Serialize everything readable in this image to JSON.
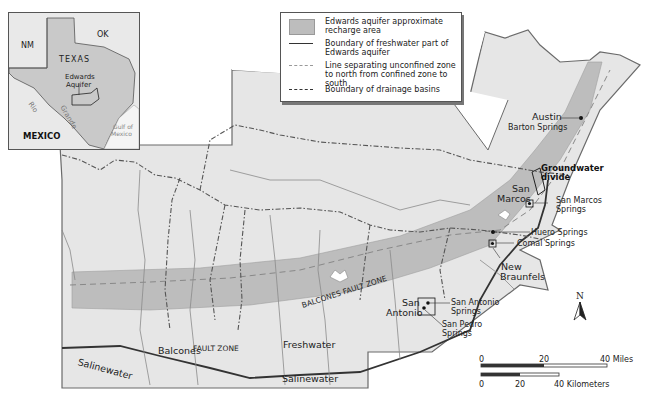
{
  "legend": {
    "items": [
      {
        "symbol": "gray-fill",
        "label": "Edwards aquifer approximate recharge area"
      },
      {
        "symbol": "solid-line",
        "label": "Boundary of freshwater part of Edwards aquifer"
      },
      {
        "symbol": "dashed-line",
        "label": "Line separating unconfined zone to north from confined zone to south"
      },
      {
        "symbol": "dash-dot-line",
        "label": "Boundary of drainage basins"
      }
    ]
  },
  "inset": {
    "labels": {
      "nm": "NM",
      "ok": "OK",
      "texas": "TEXAS",
      "aquifer_line1": "Edwards",
      "aquifer_line2": "Aquifer",
      "rio": "Rio",
      "grande": "Grande",
      "gulf_line1": "Gulf of",
      "gulf_line2": "Mexico",
      "mexico": "MEXICO"
    }
  },
  "map": {
    "labels": {
      "austin": "Austin",
      "barton_springs": "Barton Springs",
      "groundwater_divide_line1": "Groundwater",
      "groundwater_divide_line2": "divide",
      "san_marcos_line1": "San",
      "san_marcos_line2": "Marcos",
      "san_marcos_springs_line1": "San Marcos",
      "san_marcos_springs_line2": "Springs",
      "huero_springs": "Huero Springs",
      "comal_springs": "Comal Springs",
      "new_braunfels_line1": "New",
      "new_braunfels_line2": "Braunfels",
      "san_antonio_line1": "San",
      "san_antonio_line2": "Antonio",
      "san_antonio_springs_line1": "San Antonio",
      "san_antonio_springs_line2": "Springs",
      "san_pedro_springs_line1": "San Pedro",
      "san_pedro_springs_line2": "Springs",
      "balcones_fault_zone": "BALCONES FAULT ZONE",
      "balcones": "Balcones",
      "fault_zone": "FAULT ZONE",
      "freshwater": "Freshwater",
      "salinewater_west": "Salinewater",
      "salinewater_south": "Salinewater"
    },
    "north_arrow": "N",
    "scale_bar": {
      "miles": {
        "ticks": [
          "0",
          "20",
          "40 Miles"
        ]
      },
      "kilometers": {
        "ticks": [
          "0",
          "20",
          "40 Kilometers"
        ]
      }
    },
    "colors": {
      "land": "#e6e6e6",
      "recharge": "#bdbdbd",
      "line": "#555555",
      "river": "#8a8a8a"
    }
  }
}
